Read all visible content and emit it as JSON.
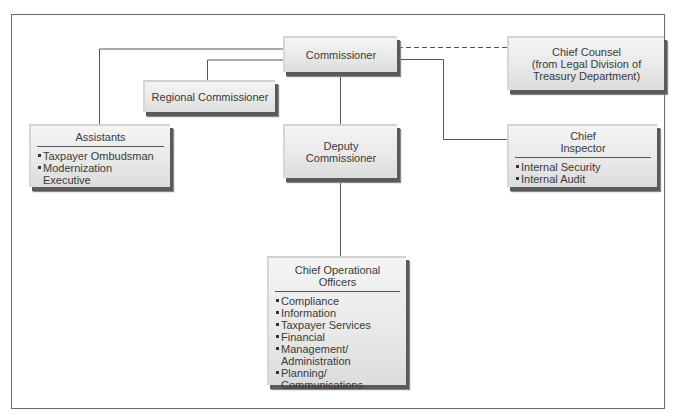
{
  "diagram": {
    "type": "org-chart",
    "nodes": {
      "commissioner": {
        "title": "Commissioner"
      },
      "chief_counsel": {
        "title_lines": [
          "Chief Counsel",
          "(from Legal Division of",
          "Treasury Department)"
        ]
      },
      "regional_commissioner": {
        "title": "Regional Commissioner"
      },
      "assistants": {
        "title": "Assistants",
        "items": [
          {
            "lines": [
              "Taxpayer Ombudsman"
            ]
          },
          {
            "lines": [
              "Modernization",
              "Executive"
            ]
          }
        ]
      },
      "deputy_commissioner": {
        "title_lines": [
          "Deputy",
          "Commissioner"
        ]
      },
      "chief_inspector": {
        "title_lines": [
          "Chief",
          "Inspector"
        ],
        "items": [
          {
            "lines": [
              "Internal Security"
            ]
          },
          {
            "lines": [
              "Internal Audit"
            ]
          }
        ]
      },
      "chief_operational_officers": {
        "title_lines": [
          "Chief Operational",
          "Officers"
        ],
        "items": [
          {
            "lines": [
              "Compliance"
            ]
          },
          {
            "lines": [
              "Information"
            ]
          },
          {
            "lines": [
              "Taxpayer Services"
            ]
          },
          {
            "lines": [
              "Financial"
            ]
          },
          {
            "lines": [
              "Management/",
              "Administration"
            ]
          },
          {
            "lines": [
              "Planning/",
              "Communications"
            ]
          }
        ]
      }
    },
    "edges": [
      {
        "from": "commissioner",
        "to": "assistants",
        "style": "solid"
      },
      {
        "from": "commissioner",
        "to": "regional_commissioner",
        "style": "solid"
      },
      {
        "from": "commissioner",
        "to": "chief_counsel",
        "style": "dashed"
      },
      {
        "from": "commissioner",
        "to": "deputy_commissioner",
        "style": "solid"
      },
      {
        "from": "commissioner",
        "to": "chief_inspector",
        "style": "solid"
      },
      {
        "from": "deputy_commissioner",
        "to": "chief_operational_officers",
        "style": "solid"
      }
    ],
    "colors": {
      "line": "#555555",
      "box_fill": "#ebebeb",
      "box_shadow": "#5a5a5a",
      "frame": "#6a6a6a"
    }
  }
}
